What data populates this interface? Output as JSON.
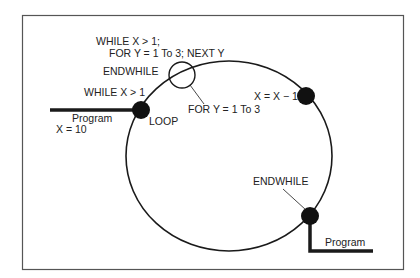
{
  "diagram": {
    "labels": {
      "while_for_line1": "WHILE X > 1;",
      "while_for_line2": "FOR Y = 1 To 3; NEXT Y",
      "endwhile_top": "ENDWHILE",
      "while_x": "WHILE X > 1",
      "program_in": "Program",
      "x_init": "X = 10",
      "loop": "LOOP",
      "for_y": "FOR Y = 1 To 3",
      "decrement": "X = X − 1",
      "endwhile_bottom": "ENDWHILE",
      "program_out": "Program"
    },
    "nodes": [
      {
        "id": "loop",
        "type": "filled-circle",
        "label": "LOOP"
      },
      {
        "id": "for-loop",
        "type": "open-circle",
        "label": "FOR Y = 1 To 3"
      },
      {
        "id": "decrement",
        "type": "filled-circle",
        "label": "X = X − 1"
      },
      {
        "id": "endwhile",
        "type": "filled-circle",
        "label": "ENDWHILE"
      }
    ],
    "colors": {
      "stroke": "#1a1a1a",
      "frame": "#555555",
      "background": "#ffffff"
    }
  }
}
